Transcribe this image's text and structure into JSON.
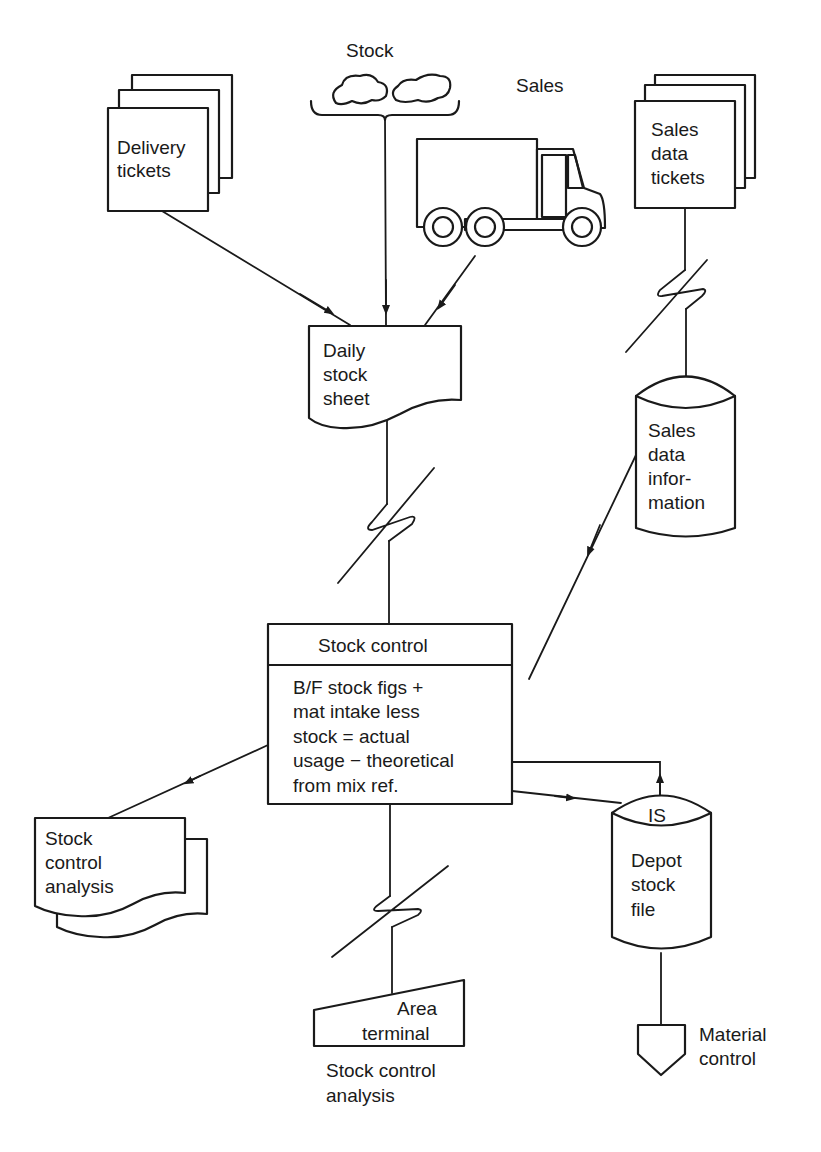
{
  "diagram": {
    "type": "system-flowchart",
    "nodes": {
      "stock": {
        "label": "Stock",
        "shape": "clouds-offline-storage"
      },
      "sales": {
        "label": "Sales",
        "shape": "delivery-truck"
      },
      "delivery_tickets": {
        "lines": [
          "Delivery",
          "tickets"
        ],
        "shape": "multi-document"
      },
      "sales_data_tickets": {
        "lines": [
          "Sales",
          "data",
          "tickets"
        ],
        "shape": "multi-document"
      },
      "daily_stock_sheet": {
        "lines": [
          "Daily",
          "stock",
          "sheet"
        ],
        "shape": "document"
      },
      "sales_data_information": {
        "lines": [
          "Sales",
          "data",
          "infor-",
          "mation"
        ],
        "shape": "online-storage"
      },
      "stock_control": {
        "title": "Stock control",
        "lines": [
          "B/F stock figs +",
          "mat intake less",
          "stock = actual",
          "usage − theoretical",
          "from mix ref."
        ],
        "shape": "process"
      },
      "stock_control_analysis_doc": {
        "lines": [
          "Stock",
          "control",
          "analysis"
        ],
        "shape": "multi-document"
      },
      "depot_stock_file": {
        "tag": "IS",
        "lines": [
          "Depot",
          "stock",
          "file"
        ],
        "shape": "online-storage"
      },
      "area_terminal": {
        "lines": [
          "Area",
          "terminal"
        ],
        "caption": [
          "Stock control",
          "analysis"
        ],
        "shape": "manual-input"
      },
      "material_control": {
        "lines": [
          "Material",
          "control"
        ],
        "shape": "off-page-connector"
      }
    },
    "edges": [
      {
        "from": "delivery_tickets",
        "to": "daily_stock_sheet",
        "arrow": true
      },
      {
        "from": "stock",
        "to": "daily_stock_sheet",
        "arrow": true
      },
      {
        "from": "sales",
        "to": "daily_stock_sheet",
        "arrow": true
      },
      {
        "from": "sales_data_tickets",
        "to": "sales_data_information",
        "link": "communication"
      },
      {
        "from": "daily_stock_sheet",
        "to": "stock_control",
        "link": "communication"
      },
      {
        "from": "sales_data_information",
        "to": "stock_control",
        "arrow": true
      },
      {
        "from": "stock_control",
        "to": "stock_control_analysis_doc",
        "arrow": true
      },
      {
        "from": "stock_control",
        "to": "depot_stock_file",
        "arrow": true
      },
      {
        "from": "depot_stock_file",
        "to": "stock_control",
        "arrow": true
      },
      {
        "from": "stock_control",
        "to": "area_terminal",
        "link": "communication"
      },
      {
        "from": "depot_stock_file",
        "to": "material_control"
      }
    ]
  }
}
